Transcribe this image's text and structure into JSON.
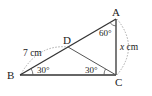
{
  "figure": {
    "type": "geometry-triangle",
    "points": {
      "A": {
        "label": "A"
      },
      "B": {
        "label": "B"
      },
      "C": {
        "label": "C"
      },
      "D": {
        "label": "D"
      }
    },
    "angles": {
      "A": "60°",
      "B": "30°",
      "DCB": "30°"
    },
    "lengths": {
      "BD": "7 cm",
      "AC_var": "x",
      "AC_unit": " cm"
    },
    "colors": {
      "line": "#333333",
      "dotted": "#aaaaaa",
      "text": "#222222"
    }
  }
}
